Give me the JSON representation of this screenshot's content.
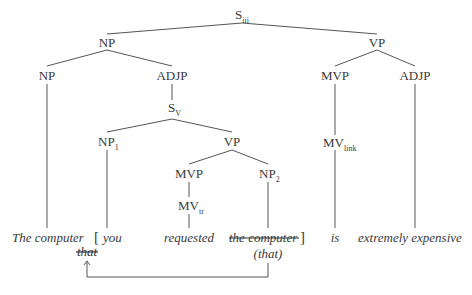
{
  "diagram": {
    "type": "syntax-tree",
    "nodes": {
      "root": {
        "label": "S",
        "sub": "iii"
      },
      "np_top": {
        "label": "NP"
      },
      "vp_top": {
        "label": "VP"
      },
      "np_head": {
        "label": "NP"
      },
      "adjp_rel": {
        "label": "ADJP"
      },
      "s_v": {
        "label": "S",
        "sub": "V"
      },
      "np1": {
        "label": "NP",
        "sub": "1"
      },
      "vp_rel": {
        "label": "VP"
      },
      "mvp_rel": {
        "label": "MVP"
      },
      "mv_tr": {
        "label": "MV",
        "sub": "tr"
      },
      "np2": {
        "label": "NP",
        "sub": "2"
      },
      "mvp_main": {
        "label": "MVP"
      },
      "mv_link": {
        "label": "MV",
        "sub": "link"
      },
      "adjp_main": {
        "label": "ADJP"
      }
    },
    "words": {
      "the_computer": "The computer",
      "open_bracket": "[",
      "you": "you",
      "requested": "requested",
      "the_computer_struck": "the computer",
      "close_bracket": "]",
      "is": "is",
      "extremely_expensive": "extremely expensive",
      "that_struck": "that",
      "that_paren": "(that)"
    },
    "movement_arrow": {
      "from": "(that)",
      "to": "that"
    }
  }
}
